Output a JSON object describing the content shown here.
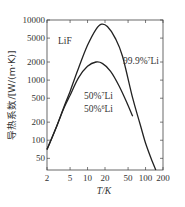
{
  "chart_data": {
    "type": "line",
    "title": "",
    "material_label": "LiF",
    "xlabel": "T/K",
    "ylabel": "导热系数/[W/(m·K)]",
    "xscale": "log",
    "yscale": "log",
    "xlim": [
      2,
      200
    ],
    "ylim": [
      32,
      10000
    ],
    "x_ticks": [
      2,
      5,
      10,
      20,
      50,
      100,
      200
    ],
    "x_tick_labels": [
      "2",
      "5",
      "10",
      "20",
      "50",
      "100",
      "200"
    ],
    "y_ticks": [
      50,
      100,
      200,
      500,
      1000,
      2000,
      5000,
      10000
    ],
    "y_tick_labels": [
      "50",
      "100",
      "200",
      "500",
      "1000",
      "2000",
      "5000",
      "10000"
    ],
    "grid": false,
    "series": [
      {
        "name": "99.9%7Li",
        "label_main": "99.9%",
        "label_sup": "7",
        "label_tail": "Li",
        "x": [
          2,
          3,
          4,
          5,
          7,
          10,
          14,
          17.5,
          22,
          30,
          40,
          60,
          80,
          100,
          130,
          150
        ],
        "y": [
          70,
          180,
          380,
          650,
          1600,
          3800,
          7000,
          8500,
          7800,
          5000,
          2500,
          500,
          190,
          90,
          45,
          32
        ]
      },
      {
        "name": "50%7Li 50%6Li",
        "label_line1_main": "50%",
        "label_line1_sup": "7",
        "label_line1_tail": "Li",
        "label_line2_main": "50%",
        "label_line2_sup": "6",
        "label_line2_tail": "Li",
        "x": [
          2,
          3,
          4,
          5,
          7,
          10,
          14,
          18,
          25,
          35,
          50,
          60
        ],
        "y": [
          70,
          180,
          360,
          560,
          1100,
          1700,
          2000,
          1900,
          1400,
          800,
          380,
          250
        ]
      }
    ]
  }
}
